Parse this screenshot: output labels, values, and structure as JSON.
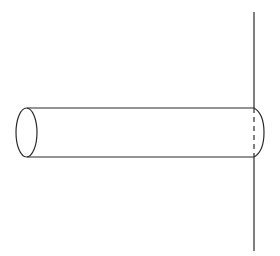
{
  "diagram": {
    "colors": {
      "background": "#ffffff",
      "stroke": "#2b2b2b"
    },
    "wall": {
      "x": 254,
      "y_top": 12,
      "y_bottom": 251
    },
    "rod": {
      "left_cap": {
        "cx": 26.5,
        "cy": 132.5,
        "rx": 10.5,
        "ry": 24.5
      },
      "top_y": 108,
      "bottom_y": 157,
      "left_x": 27,
      "right_x": 254,
      "right_cap_bulge_x": 264,
      "hidden_edge": "dashed"
    }
  }
}
